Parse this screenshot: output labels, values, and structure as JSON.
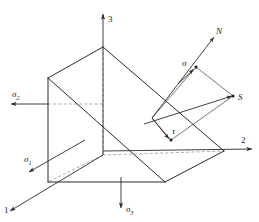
{
  "figure": {
    "axes": [
      {
        "id": "axis-1",
        "label": "1",
        "x": 5,
        "y": 211,
        "anchor": "start"
      },
      {
        "id": "axis-2",
        "label": "2",
        "x": 241,
        "y": 143,
        "anchor": "start"
      },
      {
        "id": "axis-3",
        "label": "3",
        "x": 108,
        "y": 22,
        "anchor": "start"
      }
    ],
    "stress_labels": [
      {
        "id": "sigma-1",
        "base": "σ",
        "sub": "1",
        "x": 24,
        "y": 158
      },
      {
        "id": "sigma-2",
        "base": "σ",
        "sub": "2",
        "x": 12,
        "y": 96
      },
      {
        "id": "sigma-3",
        "base": "σ",
        "sub": "3",
        "x": 124,
        "y": 210
      }
    ],
    "vector_labels": [
      {
        "id": "normal-N",
        "text": "N",
        "x": 218,
        "y": 33
      },
      {
        "id": "resultant-S",
        "text": "S",
        "x": 240,
        "y": 99
      },
      {
        "id": "normal-stress-sigma",
        "text": "σ",
        "x": 185,
        "y": 64
      },
      {
        "id": "shear-stress-tau",
        "text": "τ",
        "x": 175,
        "y": 136
      }
    ],
    "colors": {
      "ink": "#2b2b2b",
      "hidden_edge": "#8a8a8a",
      "background": "#ffffff"
    }
  }
}
